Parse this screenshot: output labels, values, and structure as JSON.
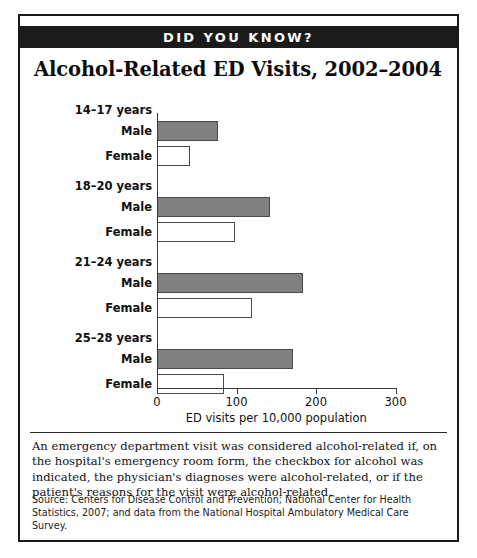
{
  "banner": {
    "label": "DID YOU KNOW?"
  },
  "title": "Alcohol-Related ED Visits, 2002–2004",
  "note": "An emergency department visit was considered alcohol-related if, on the hospital's emergency room form, the checkbox for alcohol was indicated, the physician's diagnoses were alcohol-related, or if the patient's reasons for the visit were alcohol-related.",
  "source": "Source: Centers for Disease Control and Prevention; National Center for Health Statistics, 2007; and data from the National Hospital Ambulatory Medical Care Survey.",
  "colors": {
    "male_bar": "#808080",
    "female_bar": "#ffffff",
    "bar_border": "#4a4a4a",
    "banner_bg": "#1b1b1b",
    "banner_text": "#ffffff",
    "frame": "#1a1a1a"
  },
  "chart_data": {
    "type": "bar",
    "orientation": "horizontal",
    "title": "Alcohol-Related ED Visits, 2002–2004",
    "xlabel": "ED visits per 10,000 population",
    "ylabel": "",
    "xlim": [
      0,
      320
    ],
    "xticks": [
      0,
      100,
      200,
      300
    ],
    "xtick_labels": [
      "0",
      "100",
      "200",
      "300"
    ],
    "grid": false,
    "legend": "none",
    "categories": [
      "14–17 years",
      "18–20 years",
      "21–24 years",
      "25–28 years"
    ],
    "series": [
      {
        "name": "Male",
        "values": [
          77,
          142,
          184,
          171
        ]
      },
      {
        "name": "Female",
        "values": [
          41,
          98,
          119,
          84
        ]
      }
    ],
    "groups": [
      {
        "category": "14–17 years",
        "bars": [
          {
            "label": "Male",
            "value": 77
          },
          {
            "label": "Female",
            "value": 41
          }
        ]
      },
      {
        "category": "18–20 years",
        "bars": [
          {
            "label": "Male",
            "value": 142
          },
          {
            "label": "Female",
            "value": 98
          }
        ]
      },
      {
        "category": "21–24 years",
        "bars": [
          {
            "label": "Male",
            "value": 184
          },
          {
            "label": "Female",
            "value": 119
          }
        ]
      },
      {
        "category": "25–28 years",
        "bars": [
          {
            "label": "Male",
            "value": 171
          },
          {
            "label": "Female",
            "value": 84
          }
        ]
      }
    ]
  }
}
